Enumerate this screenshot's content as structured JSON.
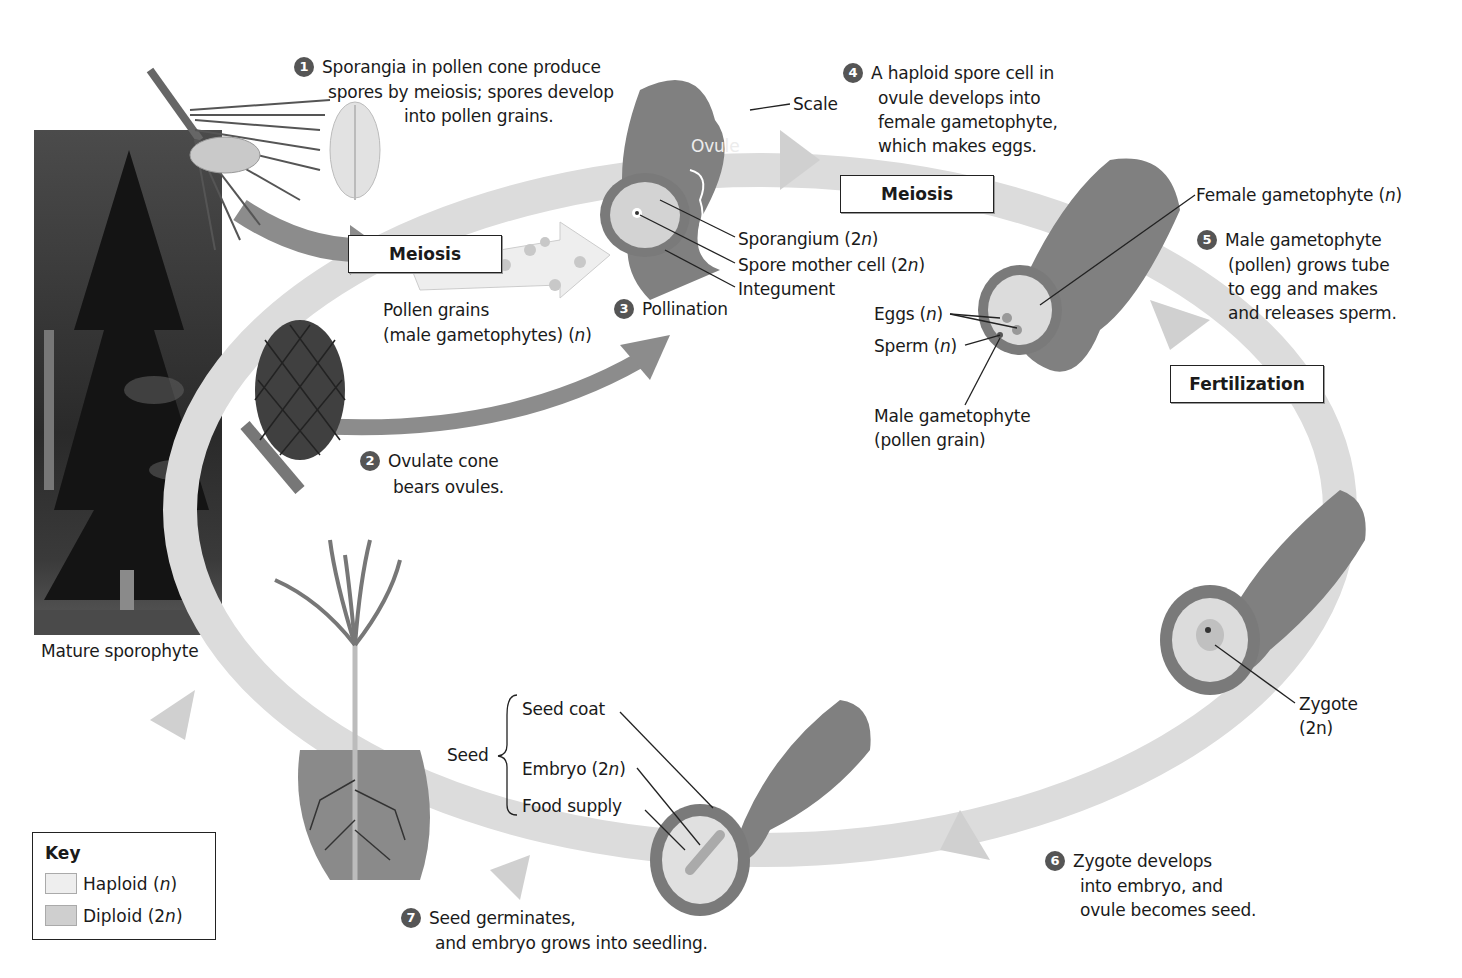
{
  "diagram": {
    "type": "life-cycle",
    "colors": {
      "haploid": "#e6e6e6",
      "diploid": "#b9b9b9",
      "scale": "#7d7d7d",
      "cycle_band": "#d6d6d6",
      "step_badge": "#555555"
    },
    "process_boxes": {
      "meiosis_left": "Meiosis",
      "meiosis_right": "Meiosis",
      "fertilization": "Fertilization"
    },
    "steps": [
      {
        "num": "1",
        "lines": [
          "Sporangia in pollen cone produce",
          "spores by meiosis; spores develop",
          "into pollen grains."
        ]
      },
      {
        "num": "2",
        "lines": [
          "Ovulate cone",
          "bears ovules."
        ]
      },
      {
        "num": "3",
        "lines": [
          "Pollination"
        ]
      },
      {
        "num": "4",
        "lines": [
          "A haploid spore cell in",
          "ovule develops into",
          "female gametophyte,",
          "which makes eggs."
        ]
      },
      {
        "num": "5",
        "lines": [
          "Male gametophyte",
          "(pollen) grows tube",
          "to egg and makes",
          "and releases sperm."
        ]
      },
      {
        "num": "6",
        "lines": [
          "Zygote develops",
          "into embryo, and",
          "ovule becomes seed."
        ]
      },
      {
        "num": "7",
        "lines": [
          "Seed germinates,",
          "and embryo grows into seedling."
        ]
      }
    ],
    "labels": {
      "scale": "Scale",
      "ovule": "Ovule",
      "sporangium": "Sporangium (2",
      "spore_mother_cell": "Spore mother cell (2",
      "integument": "Integument",
      "pollen_grains_1": "Pollen grains",
      "pollen_grains_2": "(male gametophytes) (",
      "female_gametophyte": "Female gametophyte (",
      "eggs": "Eggs (",
      "sperm": "Sperm (",
      "male_gametophyte_1": "Male gametophyte",
      "male_gametophyte_2": "(pollen grain)",
      "zygote_1": "Zygote",
      "zygote_2": "(2n)",
      "seed": "Seed",
      "seed_coat": "Seed coat",
      "embryo": "Embryo (2",
      "food_supply": "Food  supply",
      "mature_sporophyte": "Mature sporophyte",
      "n": "n",
      "close": ")"
    },
    "key": {
      "title": "Key",
      "items": [
        {
          "label": "Haploid (",
          "italic": "n",
          "close": ")",
          "color": "#eeeeee"
        },
        {
          "label": "Diploid (2",
          "italic": "n",
          "close": ")",
          "color": "#cfcfcf"
        }
      ]
    }
  }
}
